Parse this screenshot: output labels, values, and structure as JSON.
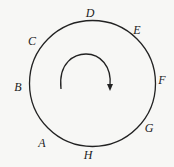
{
  "diagram": {
    "labels": {
      "A": "A",
      "B": "B",
      "C": "C",
      "D": "D",
      "E": "E",
      "F": "F",
      "G": "G",
      "H": "H"
    },
    "arrow_direction": "clockwise",
    "colors": {
      "stroke": "#222222",
      "background": "#f7f7f5"
    }
  }
}
